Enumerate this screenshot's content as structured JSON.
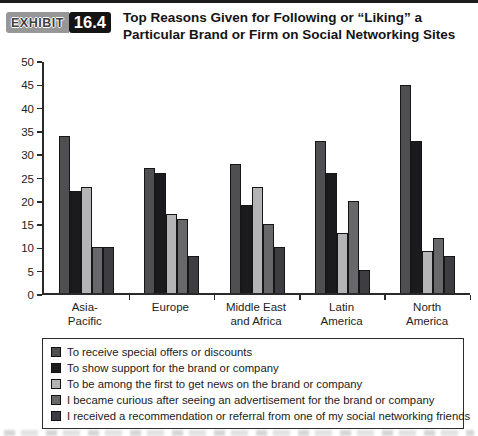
{
  "header": {
    "exhibit_label": "EXHIBIT",
    "exhibit_number": "16.4",
    "title_line1": "Top Reasons Given for Following or “Liking” a",
    "title_line2": "Particular Brand or Firm on Social Networking Sites"
  },
  "chart_data": {
    "type": "bar",
    "title": "Top Reasons Given for Following or “Liking” a Particular Brand or Firm on Social Networking Sites",
    "categories": [
      "Asia-Pacific",
      "Europe",
      "Middle East and Africa",
      "Latin America",
      "North America"
    ],
    "category_label_lines": [
      [
        "Asia-",
        "Pacific"
      ],
      [
        "Europe"
      ],
      [
        "Middle East",
        "and Africa"
      ],
      [
        "Latin",
        "America"
      ],
      [
        "North",
        "America"
      ]
    ],
    "series": [
      {
        "name": "To receive special offers or discounts",
        "color": "#4f4f52",
        "values": [
          34,
          27,
          28,
          33,
          45
        ]
      },
      {
        "name": "To show support for the brand or company",
        "color": "#1b1b1d",
        "values": [
          22,
          26,
          19,
          26,
          33
        ]
      },
      {
        "name": "To be among the first to get news on the brand or company",
        "color": "#b4b4b6",
        "values": [
          23,
          17,
          23,
          13,
          9
        ]
      },
      {
        "name": "I became curious after seeing an advertisement for the brand or company",
        "color": "#68686b",
        "values": [
          10,
          16,
          15,
          20,
          12
        ]
      },
      {
        "name": "I received a recommendation or referral from one of my social networking friends",
        "color": "#3e3e42",
        "values": [
          10,
          8,
          10,
          5,
          8
        ]
      }
    ],
    "xlabel": "",
    "ylabel": "",
    "ylim": [
      0,
      50
    ],
    "y_ticks": [
      0,
      5,
      10,
      15,
      20,
      25,
      30,
      35,
      40,
      45,
      50
    ],
    "grid": false,
    "legend_position": "bottom-box"
  }
}
